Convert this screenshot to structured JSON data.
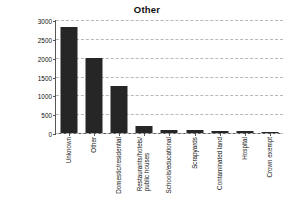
{
  "chart_data": {
    "type": "bar",
    "title": "Other",
    "xlabel": "",
    "ylabel": "Number of incidents",
    "ylim": [
      0,
      3000
    ],
    "yticks": [
      0,
      500,
      1000,
      1500,
      2000,
      2500,
      3000
    ],
    "grid": true,
    "legend": false,
    "bar_color": "#262626",
    "categories": [
      "Unknown",
      "Other",
      "Domestic/residential",
      "Restaurants/hotels/ public houses",
      "Schools/educational",
      "Scrapyards",
      "Contaminated land",
      "Hospital",
      "Crown exempt"
    ],
    "values": [
      2820,
      1980,
      1260,
      175,
      85,
      70,
      60,
      60,
      40
    ]
  },
  "axis": {
    "ytick_labels": [
      "3000",
      "2500",
      "2000",
      "1500",
      "1000",
      "500",
      "0"
    ],
    "category_lines": [
      [
        "Unknown"
      ],
      [
        "Other"
      ],
      [
        "Domestic/residential"
      ],
      [
        "Restaurants/hotels/",
        "public houses"
      ],
      [
        "Schools/educational"
      ],
      [
        "Scrapyards"
      ],
      [
        "Contaminated land"
      ],
      [
        "Hospital"
      ],
      [
        "Crown exempt"
      ]
    ]
  }
}
